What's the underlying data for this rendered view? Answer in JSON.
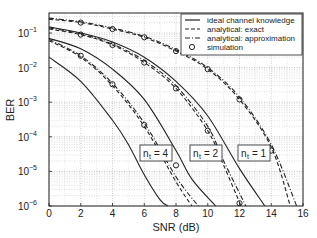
{
  "chart_data": {
    "type": "line",
    "title": "",
    "xlabel": "SNR (dB)",
    "ylabel": "BER",
    "xlim": [
      0,
      16
    ],
    "ylim": [
      1e-06,
      0.38
    ],
    "yscale": "log",
    "grid": true,
    "legend_position": "upper right",
    "xticks": [
      0,
      2,
      4,
      6,
      8,
      10,
      12,
      14,
      16
    ],
    "yticks": [
      "10^-1",
      "10^-2",
      "10^-3",
      "10^-4",
      "10^-5",
      "10^-6"
    ],
    "legend": [
      {
        "label": "ideal channel knowledge",
        "style": "solid"
      },
      {
        "label": "analytical: exact",
        "style": "dashed"
      },
      {
        "label": "analytical: approximation",
        "style": "dashdot"
      },
      {
        "label": "simulation",
        "style": "circle-marker"
      }
    ],
    "annotations": [
      "n_t = 4",
      "n_t = 2",
      "n_t = 1"
    ],
    "series": [
      {
        "name": "ideal, n_t=1",
        "group": "n_t = 1",
        "style": "solid",
        "x": [
          0,
          2,
          4,
          6,
          8,
          10,
          12,
          13.6
        ],
        "y": [
          0.15,
          0.1,
          0.055,
          0.02,
          0.004,
          0.0004,
          1.2e-05,
          1e-06
        ]
      },
      {
        "name": "exact, n_t=1",
        "group": "n_t = 1",
        "style": "dashed",
        "x": [
          0,
          2,
          4,
          6,
          8,
          10,
          12,
          14,
          15.2
        ],
        "y": [
          0.25,
          0.2,
          0.13,
          0.075,
          0.03,
          0.009,
          0.0012,
          5e-05,
          1e-06
        ]
      },
      {
        "name": "approx, n_t=1",
        "group": "n_t = 1",
        "style": "dashdot",
        "x": [
          0,
          2,
          4,
          6,
          8,
          10,
          12,
          14,
          15.6
        ],
        "y": [
          0.27,
          0.21,
          0.14,
          0.08,
          0.033,
          0.01,
          0.0014,
          6e-05,
          1e-06
        ]
      },
      {
        "name": "sim, n_t=1",
        "group": "n_t = 1",
        "style": "markers",
        "x": [
          2,
          4,
          6,
          8,
          10,
          12,
          14
        ],
        "y": [
          0.2,
          0.13,
          0.075,
          0.03,
          0.009,
          0.0012,
          4e-05
        ]
      },
      {
        "name": "ideal, n_t=2",
        "group": "n_t = 2",
        "style": "solid",
        "x": [
          0,
          2,
          4,
          6,
          8,
          9,
          10.5
        ],
        "y": [
          0.07,
          0.035,
          0.009,
          0.0012,
          4e-05,
          6e-06,
          1e-06
        ]
      },
      {
        "name": "exact, n_t=2",
        "group": "n_t = 2",
        "style": "dashed",
        "x": [
          0,
          2,
          4,
          6,
          8,
          10,
          11,
          12.1
        ],
        "y": [
          0.13,
          0.09,
          0.045,
          0.014,
          0.0025,
          0.00015,
          1.5e-05,
          1e-06
        ]
      },
      {
        "name": "approx, n_t=2",
        "group": "n_t = 2",
        "style": "dashdot",
        "x": [
          0,
          2,
          4,
          6,
          8,
          10,
          11,
          12.4
        ],
        "y": [
          0.14,
          0.095,
          0.048,
          0.016,
          0.003,
          0.0002,
          2e-05,
          1e-06
        ]
      },
      {
        "name": "sim, n_t=2",
        "group": "n_t = 2",
        "style": "markers",
        "x": [
          2,
          4,
          6,
          8,
          10,
          12
        ],
        "y": [
          0.09,
          0.045,
          0.014,
          0.0025,
          0.00015,
          1.2e-06
        ]
      },
      {
        "name": "ideal, n_t=4",
        "group": "n_t = 4",
        "style": "solid",
        "x": [
          0,
          2,
          4,
          5,
          6,
          7,
          7.5
        ],
        "y": [
          0.02,
          0.004,
          0.0003,
          6e-05,
          8e-06,
          1.5e-06,
          1e-06
        ]
      },
      {
        "name": "exact, n_t=4",
        "group": "n_t = 4",
        "style": "dashed",
        "x": [
          0,
          2,
          4,
          6,
          8,
          9
        ],
        "y": [
          0.06,
          0.02,
          0.003,
          0.0002,
          5e-06,
          1e-06
        ]
      },
      {
        "name": "approx, n_t=4",
        "group": "n_t = 4",
        "style": "dashdot",
        "x": [
          0,
          2,
          4,
          6,
          8,
          9.4
        ],
        "y": [
          0.065,
          0.022,
          0.0035,
          0.00025,
          7e-06,
          1e-06
        ]
      },
      {
        "name": "sim, n_t=4",
        "group": "n_t = 4",
        "style": "markers",
        "x": [
          2,
          4,
          6,
          8
        ],
        "y": [
          0.022,
          0.0033,
          0.00022,
          1.5e-05
        ]
      }
    ]
  },
  "labels": {
    "xlabel": "SNR (dB)",
    "ylabel": "BER",
    "xticks": [
      "0",
      "2",
      "4",
      "6",
      "8",
      "10",
      "12",
      "14",
      "16"
    ],
    "yticks_exp": [
      "-1",
      "-2",
      "-3",
      "-4",
      "-5",
      "-6"
    ],
    "legend": [
      "ideal channel knowledge",
      "analytical: exact",
      "analytical: approximation",
      "simulation"
    ],
    "annot_n": "n",
    "annot_sub": "t",
    "annot_vals": [
      "= 4",
      "= 2",
      "= 1"
    ]
  }
}
